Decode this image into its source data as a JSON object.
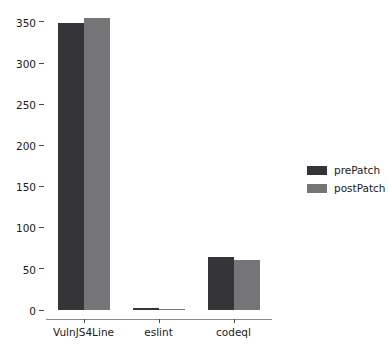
{
  "chart_data": {
    "type": "bar",
    "title": "",
    "xlabel": "",
    "ylabel": "",
    "categories": [
      "VulnJS4Line",
      "eslint",
      "codeql"
    ],
    "series": [
      {
        "name": "prePatch",
        "color": "#353539",
        "values": [
          349,
          2,
          65
        ]
      },
      {
        "name": "postPatch",
        "color": "#757578",
        "values": [
          355,
          1,
          61
        ]
      }
    ],
    "ylim": [
      0,
      362
    ],
    "yticks": [
      0,
      50,
      100,
      150,
      200,
      250,
      300,
      350
    ],
    "ytick_labels": [
      "0",
      "50",
      "100",
      "150",
      "200",
      "250",
      "300",
      "350"
    ],
    "grid": false,
    "legend_position": "right"
  },
  "legend": {
    "entries": [
      {
        "label": "prePatch"
      },
      {
        "label": "postPatch"
      }
    ]
  },
  "axis": {
    "y_tick_labels": [
      "350",
      "300",
      "250",
      "200",
      "150",
      "100",
      "50",
      "0"
    ],
    "x_tick_labels": [
      "VulnJS4Line",
      "eslint",
      "codeql"
    ]
  }
}
